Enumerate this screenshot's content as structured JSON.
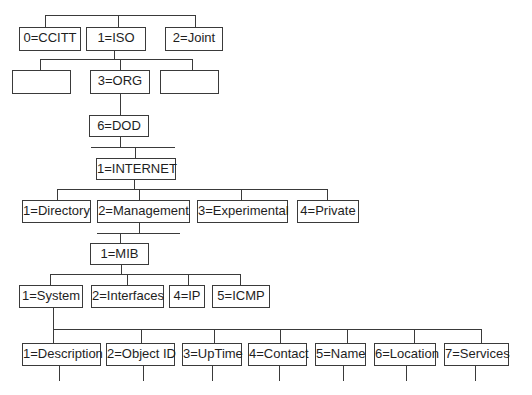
{
  "diagram": {
    "title": "",
    "level0": {
      "nodes": [
        {
          "label": "0=CCITT"
        },
        {
          "label": "1=ISO"
        },
        {
          "label": "2=Joint"
        }
      ]
    },
    "level1": {
      "nodes": [
        {
          "label": ""
        },
        {
          "label": "3=ORG"
        },
        {
          "label": ""
        }
      ]
    },
    "level2": {
      "nodes": [
        {
          "label": "6=DOD"
        }
      ]
    },
    "level3": {
      "nodes": [
        {
          "label": "1=INTERNET"
        }
      ]
    },
    "level4": {
      "nodes": [
        {
          "label": "1=Directory"
        },
        {
          "label": "2=Management"
        },
        {
          "label": "3=Experimental"
        },
        {
          "label": "4=Private"
        }
      ]
    },
    "level5": {
      "nodes": [
        {
          "label": "1=MIB"
        }
      ]
    },
    "level6": {
      "nodes": [
        {
          "label": "1=System"
        },
        {
          "label": "2=Interfaces"
        },
        {
          "label": "4=IP"
        },
        {
          "label": "5=ICMP"
        }
      ]
    },
    "level7": {
      "nodes": [
        {
          "label": "1=Description"
        },
        {
          "label": "2=Object ID"
        },
        {
          "label": "3=UpTime"
        },
        {
          "label": "4=Contact"
        },
        {
          "label": "5=Name"
        },
        {
          "label": "6=Location"
        },
        {
          "label": "7=Services"
        }
      ]
    },
    "colors": {
      "line": "#3a3a3a",
      "box_fill": "#ffffff",
      "text": "#1e1e1e"
    }
  }
}
